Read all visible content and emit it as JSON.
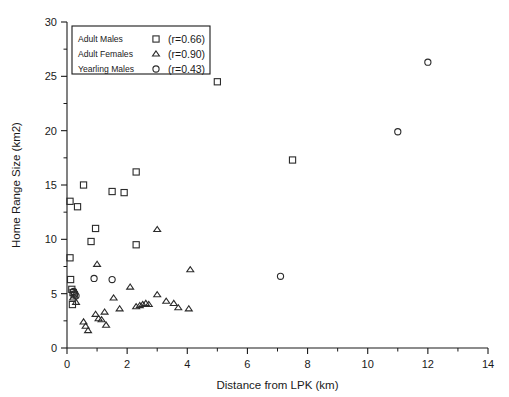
{
  "chart_data": {
    "type": "scatter",
    "title": "",
    "xlabel": "Distance from LPK (km)",
    "ylabel": "Home Range Size (km2)",
    "xlim": [
      0,
      14
    ],
    "ylim": [
      0,
      30
    ],
    "xticks": [
      0,
      2,
      4,
      6,
      8,
      10,
      12,
      14
    ],
    "yticks": [
      0,
      5,
      10,
      15,
      20,
      25,
      30
    ],
    "xtick_labels": [
      "0",
      "2",
      "4",
      "6",
      "8",
      "10",
      "12",
      "14"
    ],
    "ytick_labels": [
      "0",
      "5",
      "10",
      "15",
      "20",
      "25",
      "30"
    ],
    "x_minor_step": 1,
    "y_minor_step": 2.5,
    "grid": false,
    "legend_position": "top-left",
    "series": [
      {
        "name": "Adult Males",
        "marker": "square",
        "correlation_label": "(r=0.66)",
        "points": [
          [
            0.1,
            13.5
          ],
          [
            0.35,
            13.0
          ],
          [
            0.1,
            8.3
          ],
          [
            0.12,
            6.3
          ],
          [
            0.16,
            5.4
          ],
          [
            0.2,
            5.1
          ],
          [
            0.24,
            4.9
          ],
          [
            0.18,
            4.0
          ],
          [
            0.55,
            15.0
          ],
          [
            0.95,
            11.0
          ],
          [
            0.8,
            9.8
          ],
          [
            1.5,
            14.4
          ],
          [
            1.9,
            14.3
          ],
          [
            2.3,
            16.2
          ],
          [
            2.3,
            9.5
          ],
          [
            5.0,
            24.5
          ],
          [
            7.5,
            17.3
          ]
        ]
      },
      {
        "name": "Adult Females",
        "marker": "triangle",
        "correlation_label": "(r=0.90)",
        "points": [
          [
            0.2,
            4.6
          ],
          [
            0.3,
            4.2
          ],
          [
            0.55,
            2.4
          ],
          [
            0.62,
            2.0
          ],
          [
            0.7,
            1.6
          ],
          [
            0.95,
            3.1
          ],
          [
            1.05,
            2.7
          ],
          [
            1.15,
            2.6
          ],
          [
            1.25,
            3.3
          ],
          [
            1.3,
            2.1
          ],
          [
            1.0,
            7.7
          ],
          [
            1.55,
            4.6
          ],
          [
            1.75,
            3.6
          ],
          [
            2.1,
            5.6
          ],
          [
            2.3,
            3.8
          ],
          [
            2.42,
            3.9
          ],
          [
            2.52,
            4.0
          ],
          [
            2.62,
            4.1
          ],
          [
            2.72,
            4.0
          ],
          [
            3.0,
            4.9
          ],
          [
            3.3,
            4.3
          ],
          [
            3.55,
            4.1
          ],
          [
            3.7,
            3.7
          ],
          [
            4.05,
            3.6
          ],
          [
            3.0,
            10.9
          ],
          [
            4.1,
            7.2
          ]
        ]
      },
      {
        "name": "Yearling Males",
        "marker": "circle",
        "correlation_label": "(r=0.43)",
        "points": [
          [
            0.22,
            5.2
          ],
          [
            0.26,
            5.0
          ],
          [
            0.3,
            4.8
          ],
          [
            0.9,
            6.4
          ],
          [
            1.5,
            6.3
          ],
          [
            7.1,
            6.6
          ],
          [
            11.0,
            19.9
          ],
          [
            12.0,
            26.3
          ]
        ]
      }
    ]
  },
  "legend": {
    "rows": [
      {
        "label": "Adult Males",
        "marker": "square",
        "r": "(r=0.66)"
      },
      {
        "label": "Adult Females",
        "marker": "triangle",
        "r": "(r=0.90)"
      },
      {
        "label": "Yearling Males",
        "marker": "circle",
        "r": "(r=0.43)"
      }
    ]
  }
}
